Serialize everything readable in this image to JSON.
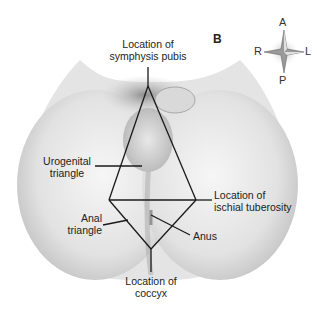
{
  "figure": {
    "panel_letter": "B",
    "compass": {
      "top": "A",
      "bottom": "P",
      "left": "R",
      "right": "L"
    },
    "labels": {
      "symphysis_line1": "Location of",
      "symphysis_line2": "symphysis pubis",
      "urogenital_line1": "Urogenital",
      "urogenital_line2": "triangle",
      "ischial_line1": "Location of",
      "ischial_line2": "ischial tuberosity",
      "anal_line1": "Anal",
      "anal_line2": "triangle",
      "anus": "Anus",
      "coccyx_line1": "Location of",
      "coccyx_line2": "coccyx"
    },
    "colors": {
      "line": "#1a1a1a",
      "skin_light": "#efefef",
      "skin_shade": "#bdbdbd"
    }
  }
}
